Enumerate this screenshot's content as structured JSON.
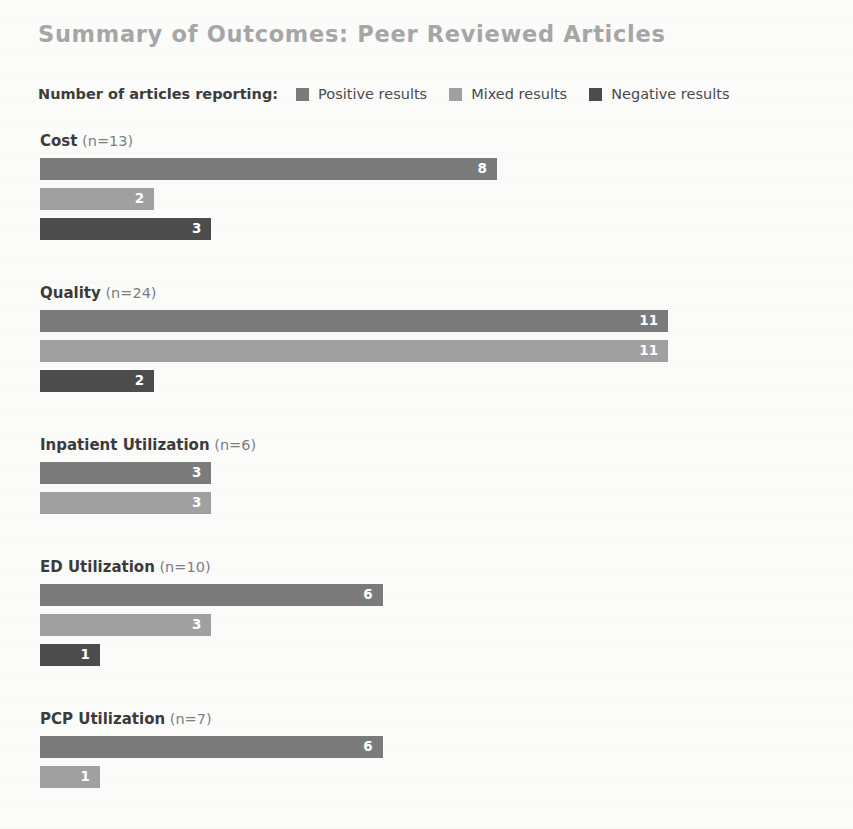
{
  "title": "Summary of Outcomes: Peer Reviewed Articles",
  "legend": {
    "caption": "Number of articles reporting:",
    "items": [
      {
        "label": "Positive results",
        "color": "#7b7b7b"
      },
      {
        "label": "Mixed results",
        "color": "#a0a0a0"
      },
      {
        "label": "Negative results",
        "color": "#4c4c4c"
      }
    ]
  },
  "chart_data": {
    "type": "bar",
    "title": "Summary of Outcomes: Peer Reviewed Articles",
    "xlabel": "",
    "ylabel": "",
    "orientation": "horizontal",
    "grid": false,
    "legend_position": "top",
    "axis_visible": false,
    "xlim": [
      0,
      11
    ],
    "categories": [
      "Cost (n=13)",
      "Quality (n=24)",
      "Inpatient Utilization (n=6)",
      "ED Utilization (n=10)",
      "PCP Utilization (n=7)"
    ],
    "series": [
      {
        "name": "Positive results",
        "color": "#7b7b7b",
        "values": [
          8,
          11,
          3,
          6,
          6
        ]
      },
      {
        "name": "Mixed results",
        "color": "#a0a0a0",
        "values": [
          2,
          11,
          3,
          3,
          1
        ]
      },
      {
        "name": "Negative results",
        "color": "#4c4c4c",
        "values": [
          3,
          2,
          null,
          1,
          null
        ]
      }
    ],
    "groups": [
      {
        "name": "Cost",
        "n": "(n=13)",
        "bars": [
          {
            "series": "Positive results",
            "value": 8,
            "label": "8",
            "color": "#7b7b7b"
          },
          {
            "series": "Mixed results",
            "value": 2,
            "label": "2",
            "color": "#a0a0a0"
          },
          {
            "series": "Negative results",
            "value": 3,
            "label": "3",
            "color": "#4c4c4c"
          }
        ]
      },
      {
        "name": "Quality",
        "n": "(n=24)",
        "bars": [
          {
            "series": "Positive results",
            "value": 11,
            "label": "11",
            "color": "#7b7b7b"
          },
          {
            "series": "Mixed results",
            "value": 11,
            "label": "11",
            "color": "#a0a0a0"
          },
          {
            "series": "Negative results",
            "value": 2,
            "label": "2",
            "color": "#4c4c4c"
          }
        ]
      },
      {
        "name": "Inpatient Utilization",
        "n": "(n=6)",
        "bars": [
          {
            "series": "Positive results",
            "value": 3,
            "label": "3",
            "color": "#7b7b7b"
          },
          {
            "series": "Mixed results",
            "value": 3,
            "label": "3",
            "color": "#a0a0a0"
          }
        ]
      },
      {
        "name": "ED Utilization",
        "n": "(n=10)",
        "bars": [
          {
            "series": "Positive results",
            "value": 6,
            "label": "6",
            "color": "#7b7b7b"
          },
          {
            "series": "Mixed results",
            "value": 3,
            "label": "3",
            "color": "#a0a0a0"
          },
          {
            "series": "Negative results",
            "value": 1,
            "label": "1",
            "color": "#4c4c4c"
          }
        ]
      },
      {
        "name": "PCP Utilization",
        "n": "(n=7)",
        "bars": [
          {
            "series": "Positive results",
            "value": 6,
            "label": "6",
            "color": "#7b7b7b"
          },
          {
            "series": "Mixed results",
            "value": 1,
            "label": "1",
            "color": "#a0a0a0"
          }
        ]
      }
    ]
  },
  "layout": {
    "bar_origin_x": 40,
    "px_per_unit": 57.1,
    "min_bar_px": 60,
    "group_gap_px": 44
  }
}
